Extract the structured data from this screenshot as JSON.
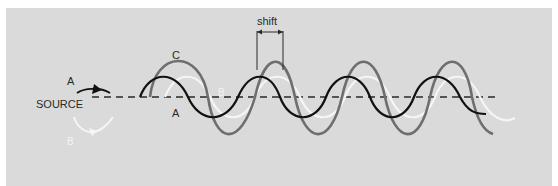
{
  "diagram": {
    "colors": {
      "background": "#dadada",
      "wave_a": "#111111",
      "wave_b": "#f5f5f5",
      "wave_c": "#6e6e6e",
      "baseline": "#2a2a2a"
    },
    "labels": {
      "source": "SOURCE",
      "arrow_a": "A",
      "arrow_b": "B",
      "wave_c": "C",
      "wave_a": "A",
      "wave_b": "B",
      "shift": "shift"
    },
    "waves": [
      {
        "name": "A",
        "description": "black wave",
        "amplitude_px": 20,
        "period_px": 90
      },
      {
        "name": "B",
        "description": "white wave, phase shifted",
        "amplitude_px": 20,
        "period_px": 90
      },
      {
        "name": "C",
        "description": "grey wave, sum of A and B",
        "amplitude_px": 35,
        "period_px": 90
      }
    ],
    "annotations": [
      {
        "type": "bracket",
        "label": "shift",
        "meaning": "phase difference between A and B"
      }
    ]
  }
}
